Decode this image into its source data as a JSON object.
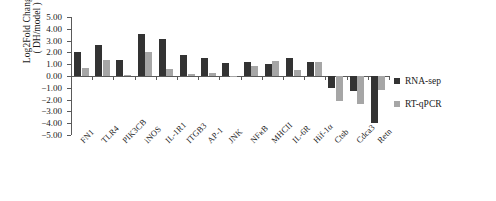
{
  "chart_data": {
    "type": "bar",
    "title": "",
    "xlabel": "",
    "ylabel": "Log2Fold Change",
    "ylabel_line2": "( DH/model )",
    "ylim": [
      -5.0,
      5.0
    ],
    "ytick_labels": [
      "5.00",
      "4.00",
      "3.00",
      "2.00",
      "1.00",
      "0.00",
      "−1.00",
      "−2.00",
      "−3.00",
      "−4.00",
      "−5.00"
    ],
    "ytick_values": [
      5,
      4,
      3,
      2,
      1,
      0,
      -1,
      -2,
      -3,
      -4,
      -5
    ],
    "grid": false,
    "legend_position": "right",
    "categories": [
      "FN1",
      "TLR4",
      "PIK3CB",
      "iNOS",
      "IL-1R1",
      "ITGB3",
      "AP-1",
      "JNK",
      "NFκB",
      "MHCII",
      "IL-6R",
      "Hif-1α",
      "Ctsb",
      "Cdca3",
      "Retn"
    ],
    "series": [
      {
        "name": "RNA-sep",
        "color": "#333333",
        "values": [
          2.0,
          2.6,
          1.35,
          3.6,
          3.15,
          1.75,
          1.5,
          1.1,
          1.15,
          1.05,
          1.55,
          1.2,
          -1.0,
          -1.3,
          -4.0
        ]
      },
      {
        "name": "RT-qPCR",
        "color": "#a6a6a6",
        "values": [
          0.65,
          1.35,
          0.1,
          2.05,
          0.6,
          0.15,
          0.25,
          0.0,
          0.85,
          1.3,
          0.55,
          1.15,
          -2.1,
          -2.35,
          -1.2
        ]
      }
    ]
  },
  "legend": {
    "items": [
      {
        "label": "RNA-sep",
        "color": "#333333"
      },
      {
        "label": "RT-qPCR",
        "color": "#a6a6a6"
      }
    ]
  }
}
